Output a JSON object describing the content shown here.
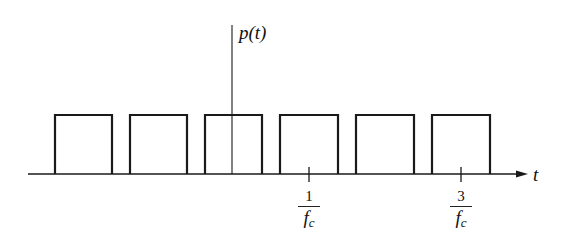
{
  "diagram": {
    "y_axis_label": "p(t)",
    "x_axis_label": "t",
    "ticks": [
      {
        "numerator": "1",
        "denominator": "f",
        "subscript": "c",
        "x": 309
      },
      {
        "numerator": "3",
        "denominator": "f",
        "subscript": "c",
        "x": 461
      }
    ],
    "pulses": [
      {
        "x0": 55,
        "x1": 112
      },
      {
        "x0": 130,
        "x1": 187
      },
      {
        "x0": 205,
        "x1": 262
      },
      {
        "x0": 280,
        "x1": 338
      },
      {
        "x0": 356,
        "x1": 414
      },
      {
        "x0": 432,
        "x1": 490
      }
    ],
    "baseline_y": 174,
    "pulse_top_y": 115,
    "axis_x_start": 28,
    "axis_x_end": 528,
    "y_axis_x": 232,
    "y_axis_top": 25,
    "line_color": "#1a1a1a"
  }
}
